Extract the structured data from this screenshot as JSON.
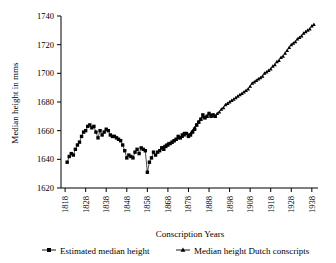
{
  "figure": {
    "background": "#ffffff",
    "foreground": "#000000"
  },
  "chart_data": {
    "type": "line",
    "title": "",
    "xlabel": "Conscription Years",
    "ylabel": "Median height in mms",
    "xlim": [
      1816,
      1941
    ],
    "ylim": [
      1620,
      1740
    ],
    "grid": false,
    "legend_position": "bottom",
    "x_ticks": [
      1818,
      1828,
      1838,
      1848,
      1858,
      1868,
      1878,
      1888,
      1898,
      1908,
      1918,
      1928,
      1938
    ],
    "y_ticks": [
      1620,
      1640,
      1660,
      1680,
      1700,
      1720,
      1740
    ],
    "series": [
      {
        "name": "Estimated median height",
        "marker": "square",
        "color": "#000000",
        "points": [
          [
            1819,
            1638
          ],
          [
            1820,
            1642
          ],
          [
            1821,
            1644
          ],
          [
            1822,
            1643
          ],
          [
            1823,
            1647
          ],
          [
            1824,
            1650
          ],
          [
            1825,
            1652
          ],
          [
            1826,
            1656
          ],
          [
            1827,
            1659
          ],
          [
            1828,
            1660
          ],
          [
            1829,
            1663
          ],
          [
            1830,
            1664
          ],
          [
            1831,
            1662
          ],
          [
            1832,
            1663
          ],
          [
            1833,
            1659
          ],
          [
            1834,
            1655
          ],
          [
            1835,
            1660
          ],
          [
            1836,
            1657
          ],
          [
            1837,
            1659
          ],
          [
            1838,
            1661
          ],
          [
            1839,
            1660
          ],
          [
            1840,
            1657
          ],
          [
            1841,
            1656
          ],
          [
            1842,
            1656
          ],
          [
            1843,
            1655
          ],
          [
            1844,
            1654
          ],
          [
            1845,
            1653
          ],
          [
            1846,
            1650
          ],
          [
            1847,
            1646
          ],
          [
            1848,
            1641
          ],
          [
            1849,
            1643
          ],
          [
            1850,
            1642
          ],
          [
            1851,
            1641
          ],
          [
            1852,
            1645
          ],
          [
            1853,
            1647
          ],
          [
            1854,
            1644
          ],
          [
            1855,
            1648
          ],
          [
            1856,
            1647
          ],
          [
            1857,
            1646
          ],
          [
            1858,
            1631
          ],
          [
            1859,
            1638
          ],
          [
            1860,
            1641
          ],
          [
            1861,
            1645
          ],
          [
            1862,
            1643
          ],
          [
            1863,
            1645
          ],
          [
            1864,
            1646
          ],
          [
            1865,
            1648
          ],
          [
            1866,
            1647
          ],
          [
            1867,
            1649
          ],
          [
            1868,
            1650
          ],
          [
            1869,
            1651
          ],
          [
            1870,
            1652
          ],
          [
            1871,
            1653
          ],
          [
            1872,
            1654
          ],
          [
            1873,
            1656
          ],
          [
            1874,
            1655
          ],
          [
            1875,
            1657
          ],
          [
            1876,
            1658
          ],
          [
            1877,
            1658
          ],
          [
            1878,
            1656
          ],
          [
            1879,
            1657
          ],
          [
            1880,
            1659
          ],
          [
            1881,
            1661
          ],
          [
            1882,
            1664
          ],
          [
            1883,
            1666
          ],
          [
            1884,
            1668
          ],
          [
            1885,
            1671
          ],
          [
            1886,
            1669
          ],
          [
            1887,
            1670
          ],
          [
            1888,
            1672
          ],
          [
            1889,
            1670
          ],
          [
            1890,
            1671
          ],
          [
            1891,
            1670
          ]
        ]
      },
      {
        "name": "Median height Dutch conscripts",
        "marker": "triangle",
        "color": "#000000",
        "points": [
          [
            1865,
            1648
          ],
          [
            1866,
            1649
          ],
          [
            1867,
            1650
          ],
          [
            1868,
            1651
          ],
          [
            1869,
            1651
          ],
          [
            1870,
            1652
          ],
          [
            1871,
            1653
          ],
          [
            1872,
            1654
          ],
          [
            1873,
            1655
          ],
          [
            1874,
            1655
          ],
          [
            1875,
            1656
          ],
          [
            1876,
            1657
          ],
          [
            1877,
            1658
          ],
          [
            1878,
            1657
          ],
          [
            1879,
            1658
          ],
          [
            1880,
            1660
          ],
          [
            1881,
            1662
          ],
          [
            1882,
            1664
          ],
          [
            1883,
            1666
          ],
          [
            1884,
            1668
          ],
          [
            1885,
            1670
          ],
          [
            1886,
            1669
          ],
          [
            1887,
            1670
          ],
          [
            1888,
            1672
          ],
          [
            1889,
            1671
          ],
          [
            1890,
            1671
          ],
          [
            1891,
            1670
          ],
          [
            1892,
            1672
          ],
          [
            1893,
            1673
          ],
          [
            1894,
            1675
          ],
          [
            1895,
            1676
          ],
          [
            1896,
            1678
          ],
          [
            1897,
            1679
          ],
          [
            1898,
            1680
          ],
          [
            1899,
            1681
          ],
          [
            1900,
            1682
          ],
          [
            1901,
            1683
          ],
          [
            1902,
            1684
          ],
          [
            1903,
            1685
          ],
          [
            1904,
            1686
          ],
          [
            1905,
            1687
          ],
          [
            1906,
            1688
          ],
          [
            1907,
            1689
          ],
          [
            1908,
            1691
          ],
          [
            1909,
            1693
          ],
          [
            1910,
            1694
          ],
          [
            1911,
            1695
          ],
          [
            1912,
            1696
          ],
          [
            1913,
            1697
          ],
          [
            1914,
            1698
          ],
          [
            1915,
            1700
          ],
          [
            1916,
            1701
          ],
          [
            1917,
            1702
          ],
          [
            1918,
            1703
          ],
          [
            1919,
            1705
          ],
          [
            1920,
            1706
          ],
          [
            1921,
            1708
          ],
          [
            1922,
            1709
          ],
          [
            1923,
            1711
          ],
          [
            1924,
            1712
          ],
          [
            1925,
            1714
          ],
          [
            1926,
            1716
          ],
          [
            1927,
            1718
          ],
          [
            1928,
            1720
          ],
          [
            1929,
            1721
          ],
          [
            1930,
            1722
          ],
          [
            1931,
            1724
          ],
          [
            1932,
            1725
          ],
          [
            1933,
            1726
          ],
          [
            1934,
            1728
          ],
          [
            1935,
            1729
          ],
          [
            1936,
            1730
          ],
          [
            1937,
            1731
          ],
          [
            1938,
            1733
          ],
          [
            1939,
            1734
          ]
        ]
      }
    ]
  },
  "legend": {
    "items": [
      {
        "label": "Estimated median height",
        "marker": "square"
      },
      {
        "label": "Median height Dutch conscripts",
        "marker": "triangle"
      }
    ]
  },
  "axis_titles": {
    "x": "Conscription Years",
    "y": "Median height in mms"
  }
}
